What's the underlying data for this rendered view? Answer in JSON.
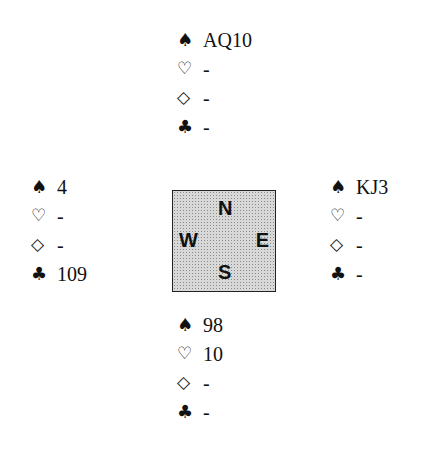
{
  "deal": {
    "north": {
      "spades": "AQ10",
      "hearts": "-",
      "diamonds": "-",
      "clubs": "-"
    },
    "west": {
      "spades": "4",
      "hearts": "-",
      "diamonds": "-",
      "clubs": "109"
    },
    "east": {
      "spades": "KJ3",
      "hearts": "-",
      "diamonds": "-",
      "clubs": "-"
    },
    "south": {
      "spades": "98",
      "hearts": "10",
      "diamonds": "-",
      "clubs": "-"
    }
  },
  "suits": {
    "spades": "♠",
    "hearts": "♡",
    "diamonds": "◇",
    "clubs": "♣"
  },
  "compass": {
    "north": "N",
    "west": "W",
    "east": "E",
    "south": "S"
  }
}
